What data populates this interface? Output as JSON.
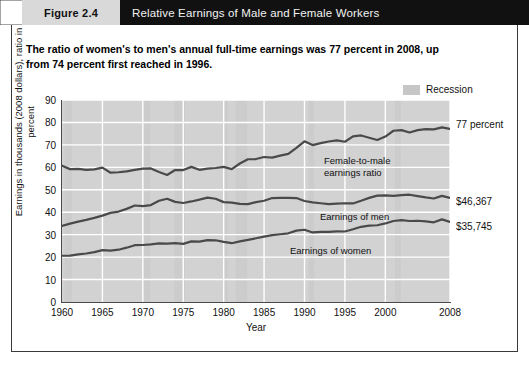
{
  "header": {
    "figure_label": "Figure 2.4",
    "title": "Relative Earnings of Male and Female Workers"
  },
  "subtitle": "The ratio of women's to men's annual full-time earnings was 77 percent in 2008, up from 74 percent first reached in 1996.",
  "legend": {
    "recession_label": "Recession",
    "recession_color": "#c6c6c6"
  },
  "annotations": {
    "female_to_male_line1": "Female-to-male",
    "female_to_male_line2": "earnings ratio",
    "earnings_of_men": "Earnings of men",
    "earnings_of_women": "Earnings of women"
  },
  "end_labels": {
    "ratio": "77 percent",
    "men": "$46,367",
    "women": "$35,745"
  },
  "chart_data": {
    "type": "line",
    "title": "Relative Earnings of Male and Female Workers",
    "xlabel": "Year",
    "ylabel": "Earnings in thousands (2008 dollars), ratio in percent",
    "xlim": [
      1960,
      2008
    ],
    "ylim": [
      0,
      90
    ],
    "yticks": [
      0,
      10,
      20,
      30,
      40,
      50,
      60,
      70,
      80,
      90
    ],
    "xticks": [
      1960,
      1965,
      1970,
      1975,
      1980,
      1985,
      1990,
      1995,
      2000,
      2008
    ],
    "grid": true,
    "legend_position": "top-right",
    "line_color": "#4a4a4a",
    "plot_background": "#d2d2d2",
    "gridline_color": "#ffffff",
    "x": [
      1960,
      1961,
      1962,
      1963,
      1964,
      1965,
      1966,
      1967,
      1968,
      1969,
      1970,
      1971,
      1972,
      1973,
      1974,
      1975,
      1976,
      1977,
      1978,
      1979,
      1980,
      1981,
      1982,
      1983,
      1984,
      1985,
      1986,
      1987,
      1988,
      1989,
      1990,
      1991,
      1992,
      1993,
      1994,
      1995,
      1996,
      1997,
      1998,
      1999,
      2000,
      2001,
      2002,
      2003,
      2004,
      2005,
      2006,
      2007,
      2008
    ],
    "series": [
      {
        "name": "Female-to-male earnings ratio",
        "units": "percent",
        "end_label": "77 percent",
        "values": [
          60.7,
          59.2,
          59.3,
          58.9,
          59.1,
          59.9,
          57.6,
          57.8,
          58.2,
          58.9,
          59.4,
          59.5,
          57.9,
          56.6,
          58.8,
          58.8,
          60.2,
          58.9,
          59.4,
          59.7,
          60.2,
          59.2,
          61.7,
          63.6,
          63.7,
          64.6,
          64.3,
          65.2,
          66.0,
          68.7,
          71.6,
          69.9,
          70.8,
          71.5,
          72.0,
          71.4,
          73.8,
          74.2,
          73.2,
          72.2,
          73.7,
          76.3,
          76.6,
          75.5,
          76.6,
          77.0,
          76.9,
          77.8,
          77.1
        ]
      },
      {
        "name": "Earnings of men",
        "units": "thousands of 2008 dollars",
        "end_label": "$46,367",
        "values": [
          33.9,
          34.9,
          35.8,
          36.6,
          37.5,
          38.5,
          39.7,
          40.3,
          41.5,
          43.0,
          42.7,
          43.2,
          45.1,
          46.0,
          44.6,
          44.1,
          44.8,
          45.6,
          46.5,
          46.0,
          44.5,
          44.3,
          43.7,
          43.6,
          44.5,
          45.1,
          46.3,
          46.4,
          46.4,
          46.3,
          45.0,
          44.4,
          44.0,
          43.6,
          43.8,
          44.0,
          43.9,
          45.1,
          46.4,
          47.4,
          47.5,
          47.3,
          47.6,
          47.8,
          47.2,
          46.6,
          46.1,
          47.3,
          46.4
        ]
      },
      {
        "name": "Earnings of women",
        "units": "thousands of 2008 dollars",
        "end_label": "$35,745",
        "values": [
          20.6,
          20.7,
          21.2,
          21.6,
          22.2,
          23.1,
          22.9,
          23.3,
          24.2,
          25.3,
          25.4,
          25.7,
          26.1,
          26.0,
          26.2,
          25.9,
          27.0,
          26.9,
          27.6,
          27.5,
          26.8,
          26.2,
          27.0,
          27.7,
          28.4,
          29.1,
          29.8,
          30.2,
          30.6,
          31.8,
          32.2,
          31.0,
          31.2,
          31.2,
          31.5,
          31.4,
          32.4,
          33.5,
          34.0,
          34.2,
          35.0,
          36.1,
          36.5,
          36.1,
          36.2,
          35.9,
          35.5,
          36.8,
          35.7
        ]
      }
    ],
    "recession_bands": [
      {
        "start": 1960.3,
        "end": 1961.2
      },
      {
        "start": 1969.9,
        "end": 1970.9
      },
      {
        "start": 1973.9,
        "end": 1975.2
      },
      {
        "start": 1980.0,
        "end": 1980.5
      },
      {
        "start": 1981.5,
        "end": 1982.9
      },
      {
        "start": 1990.5,
        "end": 1991.2
      },
      {
        "start": 2001.2,
        "end": 2001.9
      },
      {
        "start": 2007.9,
        "end": 2008.0
      }
    ]
  }
}
